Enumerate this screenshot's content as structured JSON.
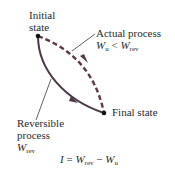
{
  "diagram": {
    "initial_state": {
      "line1": "Initial",
      "line2": "state"
    },
    "final_state": "Final state",
    "actual_process": {
      "label": "Actual process",
      "relation": {
        "lhs": "W",
        "lhs_sub": "u",
        "op": " < ",
        "rhs": "W",
        "rhs_sub": "rev"
      }
    },
    "reversible_process": {
      "line1": "Reversible",
      "line2": "process",
      "work": {
        "sym": "W",
        "sub": "rev"
      }
    },
    "equation": {
      "lhs": "I",
      "eq": " = ",
      "t1": "W",
      "t1_sub": "rev",
      "minus": " − ",
      "t2": "W",
      "t2_sub": "u"
    },
    "colors": {
      "actual_dashed": "#5a3a44",
      "reversible_solid": "#4a3a4a",
      "text": "#2a2a2a",
      "leader": "#3a3a3a"
    }
  }
}
